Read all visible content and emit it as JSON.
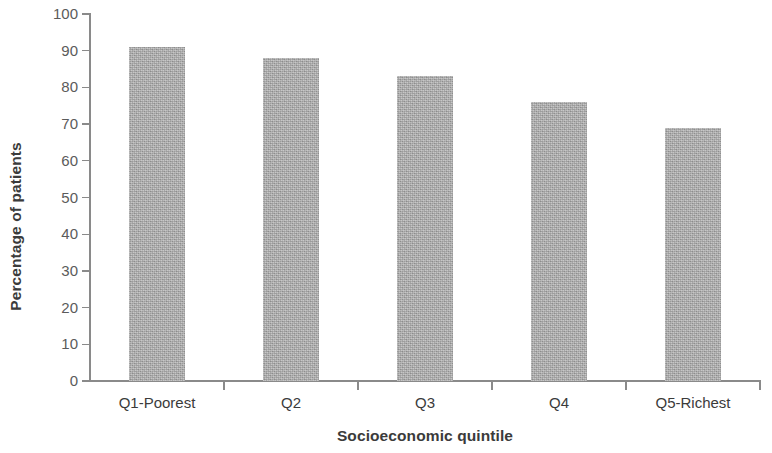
{
  "chart_data": {
    "type": "bar",
    "title": "",
    "xlabel": "Socioeconomic quintile",
    "ylabel": "Percentage of patients",
    "categories": [
      "Q1-Poorest",
      "Q2",
      "Q3",
      "Q4",
      "Q5-Richest"
    ],
    "values": [
      91,
      88,
      83,
      76,
      69
    ],
    "ylim": [
      0,
      100
    ],
    "yticks": [
      0,
      10,
      20,
      30,
      40,
      50,
      60,
      70,
      80,
      90,
      100
    ],
    "ytick_labels": [
      "0",
      "10",
      "20",
      "30",
      "40",
      "50",
      "60",
      "70",
      "80",
      "90",
      "100"
    ],
    "grid": false,
    "legend": null,
    "bar_color": "#a9a9a9",
    "axis_color": "#8a8a8a",
    "tick_label_color": "#5b5b5b",
    "axis_title_color": "#3b3b3b",
    "background_color": "#ffffff"
  }
}
